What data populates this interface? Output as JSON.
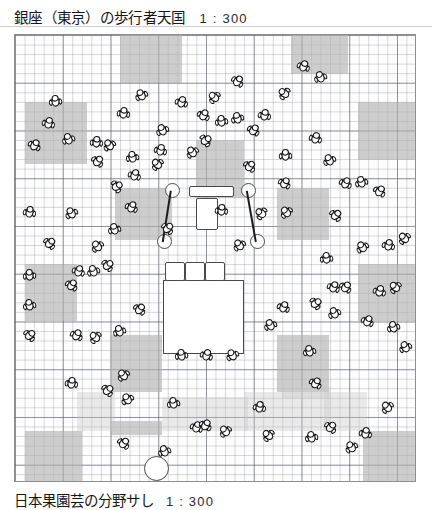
{
  "header": {
    "title": "銀座（東京）の歩行者天国",
    "scale": "1 : 300"
  },
  "footer": {
    "title": "日本果園芸の分野サし",
    "scale": "1 : 300"
  },
  "map": {
    "name": "ginza-pedestrian-paradise-plan",
    "description": "俯瞰図：歩行者天国の人と建物の配置",
    "grid": {
      "fine_cell_px": 9.55,
      "coarse_cell_px": 47.75,
      "fine_line_color": "#787d87",
      "coarse_line_color": "#555a64",
      "border_color": "#8e8e8e"
    },
    "colors": {
      "block_dark": "#b0b0b0",
      "block_light": "#c8c8c8",
      "structure_fill": "#ffffff",
      "structure_stroke": "#4a4a4a",
      "figure_stroke": "#111111",
      "barrier_stroke": "#1c1c1c"
    },
    "blocks": [
      {
        "name": "block-top-left-a",
        "tone": "dark",
        "x": 105,
        "y": 0,
        "w": 62,
        "h": 48
      },
      {
        "name": "block-top-right-a",
        "tone": "dark",
        "x": 276,
        "y": 0,
        "w": 57,
        "h": 39
      },
      {
        "name": "block-left-upper",
        "tone": "dark",
        "x": 10,
        "y": 67,
        "w": 62,
        "h": 62
      },
      {
        "name": "block-center-upper",
        "tone": "dark",
        "x": 181,
        "y": 105,
        "w": 48,
        "h": 58
      },
      {
        "name": "block-right-upper",
        "tone": "dark",
        "x": 343,
        "y": 67,
        "w": 57,
        "h": 58
      },
      {
        "name": "block-center-left-mid",
        "tone": "dark",
        "x": 100,
        "y": 153,
        "w": 57,
        "h": 52
      },
      {
        "name": "block-right-mid",
        "tone": "dark",
        "x": 262,
        "y": 153,
        "w": 52,
        "h": 52
      },
      {
        "name": "block-left-lower",
        "tone": "dark",
        "x": 10,
        "y": 229,
        "w": 52,
        "h": 57
      },
      {
        "name": "block-right-lower",
        "tone": "dark",
        "x": 343,
        "y": 229,
        "w": 62,
        "h": 57
      },
      {
        "name": "block-center-lower",
        "tone": "dark",
        "x": 95,
        "y": 300,
        "w": 52,
        "h": 57
      },
      {
        "name": "block-right-bottom-a",
        "tone": "dark",
        "x": 262,
        "y": 300,
        "w": 52,
        "h": 57
      },
      {
        "name": "block-bottom-left",
        "tone": "dark",
        "x": 10,
        "y": 396,
        "w": 57,
        "h": 52
      },
      {
        "name": "block-bottom-right",
        "tone": "dark",
        "x": 348,
        "y": 396,
        "w": 54,
        "h": 52
      },
      {
        "name": "block-bottom-center-a",
        "tone": "dark",
        "x": 95,
        "y": 386,
        "w": 52,
        "h": 14
      },
      {
        "name": "band-left-light",
        "tone": "light",
        "x": 62,
        "y": 357,
        "w": 38,
        "h": 39
      },
      {
        "name": "band-mid-light",
        "tone": "light",
        "x": 147,
        "y": 362,
        "w": 86,
        "h": 34
      },
      {
        "name": "band-right-light",
        "tone": "light",
        "x": 229,
        "y": 357,
        "w": 86,
        "h": 39
      },
      {
        "name": "band-far-right-light",
        "tone": "light",
        "x": 309,
        "y": 357,
        "w": 43,
        "h": 39
      },
      {
        "name": "band-top-right-light",
        "tone": "light",
        "x": 267,
        "y": 352,
        "w": 48,
        "h": 12
      }
    ],
    "structures": [
      {
        "name": "main-stage-building",
        "shape": "rect",
        "x": 148,
        "y": 245,
        "w": 79,
        "h": 72
      },
      {
        "name": "service-vehicle",
        "shape": "soft",
        "x": 181,
        "y": 163,
        "w": 20,
        "h": 30
      },
      {
        "name": "stage-canopy-bar",
        "shape": "soft",
        "x": 174,
        "y": 151,
        "w": 43,
        "h": 9
      },
      {
        "name": "bench-left",
        "shape": "soft",
        "x": 150,
        "y": 227,
        "w": 18,
        "h": 17
      },
      {
        "name": "bench-center",
        "shape": "soft",
        "x": 170,
        "y": 227,
        "w": 18,
        "h": 17
      },
      {
        "name": "bench-right",
        "shape": "soft",
        "x": 190,
        "y": 227,
        "w": 18,
        "h": 17
      },
      {
        "name": "barrier-post-nw",
        "shape": "round",
        "x": 150,
        "y": 148,
        "w": 13,
        "h": 13
      },
      {
        "name": "barrier-post-ne",
        "shape": "round",
        "x": 226,
        "y": 148,
        "w": 13,
        "h": 13
      },
      {
        "name": "barrier-post-sw",
        "shape": "round",
        "x": 142,
        "y": 199,
        "w": 13,
        "h": 13
      },
      {
        "name": "barrier-post-se",
        "shape": "round",
        "x": 235,
        "y": 199,
        "w": 13,
        "h": 13
      },
      {
        "name": "plaza-manhole",
        "shape": "round",
        "x": 129,
        "y": 421,
        "w": 23,
        "h": 23
      }
    ],
    "barriers": [
      {
        "name": "barrier-rope-left",
        "x1": 156,
        "y1": 155,
        "x2": 148,
        "y2": 206
      },
      {
        "name": "barrier-rope-right",
        "x1": 232,
        "y1": 155,
        "x2": 241,
        "y2": 206
      }
    ],
    "pedestrian_count": 96,
    "pedestrians": [
      {
        "x": 33,
        "y": 88,
        "r": 15
      },
      {
        "x": 53,
        "y": 104,
        "r": -20
      },
      {
        "x": 19,
        "y": 110,
        "r": 30
      },
      {
        "x": 81,
        "y": 107,
        "r": 5
      },
      {
        "x": 94,
        "y": 110,
        "r": -35
      },
      {
        "x": 82,
        "y": 126,
        "r": 40
      },
      {
        "x": 117,
        "y": 122,
        "r": -10
      },
      {
        "x": 119,
        "y": 140,
        "r": 20
      },
      {
        "x": 101,
        "y": 151,
        "r": 60
      },
      {
        "x": 147,
        "y": 95,
        "r": -25
      },
      {
        "x": 145,
        "y": 115,
        "r": 15
      },
      {
        "x": 142,
        "y": 129,
        "r": -45
      },
      {
        "x": 116,
        "y": 172,
        "r": 25
      },
      {
        "x": 99,
        "y": 194,
        "r": -15
      },
      {
        "x": 14,
        "y": 177,
        "r": 10
      },
      {
        "x": 56,
        "y": 178,
        "r": -30
      },
      {
        "x": 34,
        "y": 208,
        "r": 45
      },
      {
        "x": 14,
        "y": 240,
        "r": -5
      },
      {
        "x": 56,
        "y": 250,
        "r": 35
      },
      {
        "x": 82,
        "y": 211,
        "r": -40
      },
      {
        "x": 63,
        "y": 236,
        "r": 20
      },
      {
        "x": 78,
        "y": 236,
        "r": -20
      },
      {
        "x": 92,
        "y": 230,
        "r": 50
      },
      {
        "x": 14,
        "y": 270,
        "r": -12
      },
      {
        "x": 108,
        "y": 78,
        "r": 8
      },
      {
        "x": 126,
        "y": 60,
        "r": -28
      },
      {
        "x": 166,
        "y": 67,
        "r": 18
      },
      {
        "x": 199,
        "y": 62,
        "r": -48
      },
      {
        "x": 188,
        "y": 80,
        "r": 28
      },
      {
        "x": 206,
        "y": 86,
        "r": -8
      },
      {
        "x": 222,
        "y": 46,
        "r": 38
      },
      {
        "x": 222,
        "y": 83,
        "r": -18
      },
      {
        "x": 190,
        "y": 105,
        "r": 55
      },
      {
        "x": 177,
        "y": 117,
        "r": -38
      },
      {
        "x": 249,
        "y": 80,
        "r": 12
      },
      {
        "x": 269,
        "y": 58,
        "r": -52
      },
      {
        "x": 288,
        "y": 31,
        "r": 22
      },
      {
        "x": 305,
        "y": 42,
        "r": -22
      },
      {
        "x": 234,
        "y": 131,
        "r": 42
      },
      {
        "x": 270,
        "y": 120,
        "r": -2
      },
      {
        "x": 269,
        "y": 148,
        "r": 32
      },
      {
        "x": 271,
        "y": 177,
        "r": -42
      },
      {
        "x": 300,
        "y": 103,
        "r": 16
      },
      {
        "x": 314,
        "y": 125,
        "r": -26
      },
      {
        "x": 320,
        "y": 180,
        "r": 46
      },
      {
        "x": 311,
        "y": 223,
        "r": -6
      },
      {
        "x": 330,
        "y": 148,
        "r": 26
      },
      {
        "x": 346,
        "y": 147,
        "r": -16
      },
      {
        "x": 364,
        "y": 156,
        "r": 36
      },
      {
        "x": 347,
        "y": 212,
        "r": -34
      },
      {
        "x": 373,
        "y": 210,
        "r": 14
      },
      {
        "x": 389,
        "y": 203,
        "r": -44
      },
      {
        "x": 318,
        "y": 252,
        "r": 24
      },
      {
        "x": 319,
        "y": 278,
        "r": -24
      },
      {
        "x": 300,
        "y": 268,
        "r": 54
      },
      {
        "x": 294,
        "y": 316,
        "r": -14
      },
      {
        "x": 238,
        "y": 95,
        "r": 34
      },
      {
        "x": 246,
        "y": 178,
        "r": -56
      },
      {
        "x": 206,
        "y": 175,
        "r": 6
      },
      {
        "x": 224,
        "y": 210,
        "r": -36
      },
      {
        "x": 152,
        "y": 193,
        "r": 44
      },
      {
        "x": 166,
        "y": 320,
        "r": -9
      },
      {
        "x": 191,
        "y": 320,
        "r": 19
      },
      {
        "x": 217,
        "y": 320,
        "r": -29
      },
      {
        "x": 124,
        "y": 274,
        "r": 39
      },
      {
        "x": 104,
        "y": 296,
        "r": -19
      },
      {
        "x": 61,
        "y": 300,
        "r": 29
      },
      {
        "x": 80,
        "y": 302,
        "r": -49
      },
      {
        "x": 56,
        "y": 348,
        "r": 9
      },
      {
        "x": 108,
        "y": 340,
        "r": -39
      },
      {
        "x": 92,
        "y": 355,
        "r": 49
      },
      {
        "x": 158,
        "y": 368,
        "r": -11
      },
      {
        "x": 181,
        "y": 392,
        "r": 21
      },
      {
        "x": 112,
        "y": 364,
        "r": -31
      },
      {
        "x": 108,
        "y": 408,
        "r": 41
      },
      {
        "x": 149,
        "y": 416,
        "r": -21
      },
      {
        "x": 190,
        "y": 390,
        "r": 31
      },
      {
        "x": 210,
        "y": 396,
        "r": -41
      },
      {
        "x": 244,
        "y": 372,
        "r": 11
      },
      {
        "x": 253,
        "y": 400,
        "r": -51
      },
      {
        "x": 268,
        "y": 272,
        "r": 23
      },
      {
        "x": 255,
        "y": 290,
        "r": -23
      },
      {
        "x": 300,
        "y": 348,
        "r": 33
      },
      {
        "x": 296,
        "y": 402,
        "r": -13
      },
      {
        "x": 315,
        "y": 392,
        "r": 43
      },
      {
        "x": 336,
        "y": 412,
        "r": -33
      },
      {
        "x": 350,
        "y": 398,
        "r": 13
      },
      {
        "x": 372,
        "y": 372,
        "r": -43
      },
      {
        "x": 352,
        "y": 286,
        "r": 27
      },
      {
        "x": 378,
        "y": 292,
        "r": -17
      },
      {
        "x": 330,
        "y": 252,
        "r": 37
      },
      {
        "x": 380,
        "y": 252,
        "r": -47
      },
      {
        "x": 364,
        "y": 256,
        "r": 17
      },
      {
        "x": 390,
        "y": 312,
        "r": -27
      },
      {
        "x": 14,
        "y": 300,
        "r": 47
      },
      {
        "x": 40,
        "y": 66,
        "r": -7
      }
    ]
  }
}
